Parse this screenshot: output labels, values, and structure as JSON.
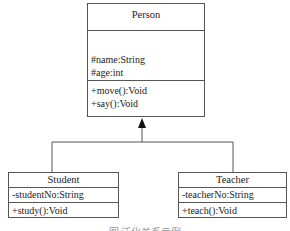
{
  "diagram": {
    "type": "UML class diagram (generalization)",
    "classes": [
      {
        "name": "Person",
        "attributes": [
          "#name:String",
          "#age:int"
        ],
        "methods": [
          "+move():Void",
          "+say():Void"
        ]
      },
      {
        "name": "Student",
        "attributes": [
          "-studentNo:String"
        ],
        "methods": [
          "+study():Void"
        ]
      },
      {
        "name": "Teacher",
        "attributes": [
          "-teacherNo:String"
        ],
        "methods": [
          "+teach():Void"
        ]
      }
    ],
    "relations": [
      {
        "from": "Student",
        "to": "Person",
        "kind": "generalization"
      },
      {
        "from": "Teacher",
        "to": "Person",
        "kind": "generalization"
      }
    ],
    "caption": "图 泛化关系示例"
  }
}
